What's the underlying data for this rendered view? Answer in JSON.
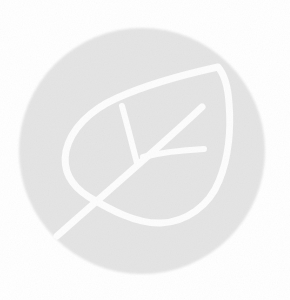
{
  "page": {
    "background_color": "#ffffff"
  },
  "logo": {
    "name": "leaf-logo-mark",
    "icon": "leaf-icon",
    "circle_color": "#e4e4e4",
    "leaf_stroke_color": "#fdfdfd"
  }
}
